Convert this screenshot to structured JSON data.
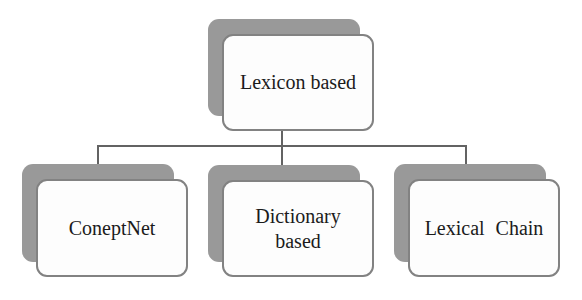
{
  "diagram": {
    "type": "tree",
    "root": {
      "id": "lexicon-based",
      "lines": [
        "Lexicon based"
      ]
    },
    "children": [
      {
        "id": "coneptnet",
        "lines": [
          "ConeptNet"
        ]
      },
      {
        "id": "dictionary-based",
        "lines": [
          "Dictionary",
          "based"
        ]
      },
      {
        "id": "lexical-chain",
        "lines": [
          "Lexical Chain"
        ]
      }
    ],
    "colors": {
      "background": "#ffffff",
      "card_fill": "#fdfdfd",
      "card_border": "#828282",
      "shadow_fill": "#999999",
      "connector": "#636363",
      "text": "#1b1b1b"
    }
  }
}
